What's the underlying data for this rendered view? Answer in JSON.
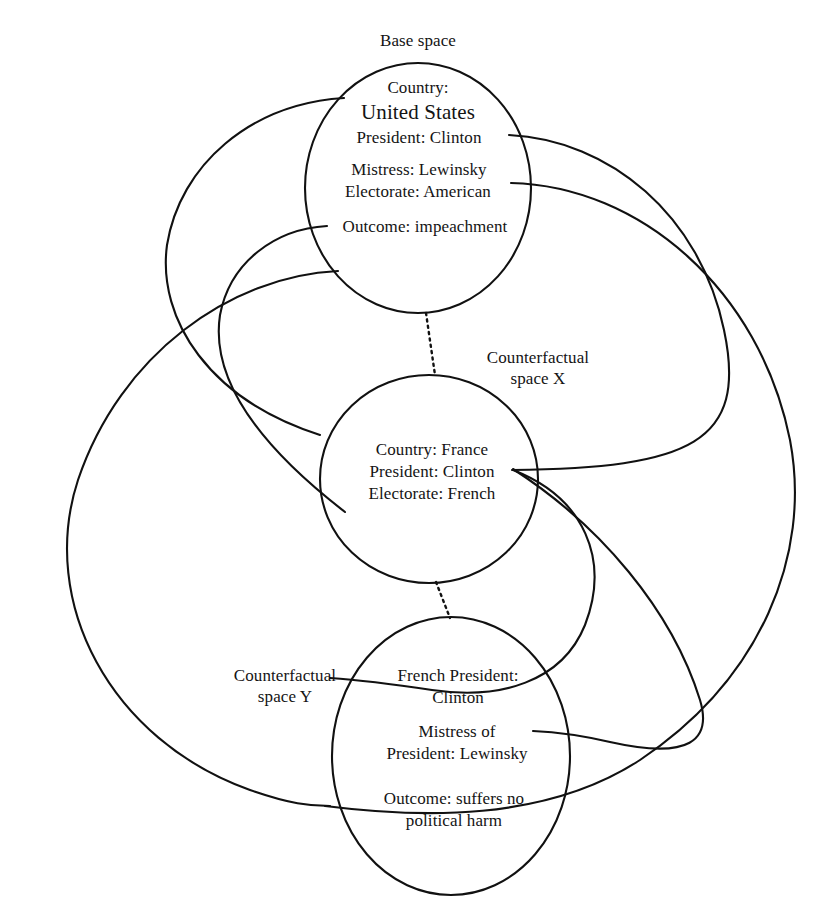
{
  "diagram": {
    "type": "mental-space-blending-diagram",
    "background_color": "#ffffff",
    "stroke_color": "#111111",
    "spaces": [
      {
        "id": "base",
        "title": "Base space",
        "title_position": "above-circle",
        "items": [
          "Country:",
          "United States",
          "President: Clinton",
          "Mistress: Lewinsky",
          "Electorate: American",
          "Outcome: impeachment"
        ]
      },
      {
        "id": "counterfactual-x",
        "title": "Counterfactual\nspace X",
        "title_position": "upper-right-of-circle",
        "items": [
          "Country: France",
          "President: Clinton",
          "Electorate: French"
        ]
      },
      {
        "id": "counterfactual-y",
        "title": "Counterfactual\nspace Y",
        "title_position": "left-of-circle",
        "items": [
          "French President:",
          "Clinton",
          "Mistress of",
          "President: Lewinsky",
          "Outcome: suffers no",
          "political harm"
        ]
      }
    ],
    "base_space_label": "Base space",
    "counterfactual_x_label_line1": "Counterfactual",
    "counterfactual_x_label_line2": "space X",
    "counterfactual_y_label_line1": "Counterfactual",
    "counterfactual_y_label_line2": "space Y",
    "base": {
      "country_key": "Country:",
      "country_value": "United States",
      "president": "President: Clinton",
      "mistress": "Mistress: Lewinsky",
      "electorate": "Electorate: American",
      "outcome": "Outcome: impeachment"
    },
    "cfx": {
      "country": "Country: France",
      "president": "President: Clinton",
      "electorate": "Electorate: French"
    },
    "cfy": {
      "president_line1": "French President:",
      "president_line2": "Clinton",
      "mistress_line1": "Mistress of",
      "mistress_line2": "President: Lewinsky",
      "outcome_line1": "Outcome: suffers no",
      "outcome_line2": "political harm"
    },
    "connector_style": {
      "mapping_arcs": "solid-curved",
      "space_links": "dotted-vertical"
    }
  }
}
